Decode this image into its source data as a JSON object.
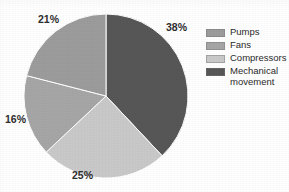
{
  "chart_data": {
    "type": "pie",
    "title": "",
    "subtitle": "",
    "xlabel": "",
    "ylabel": "",
    "grid": false,
    "legend_position": "right",
    "start_angle_deg": 0,
    "direction": "clockwise",
    "categories": [
      "Pumps",
      "Fans",
      "Compressors",
      "Mechanical movement"
    ],
    "values": [
      21,
      16,
      25,
      38
    ],
    "value_unit": "%",
    "data_labels": [
      "21%",
      "16%",
      "25%",
      "38%"
    ],
    "slices": [
      {
        "label": "Pumps",
        "value": 21,
        "data_label": "21%",
        "color": "#9c9c9c"
      },
      {
        "label": "Fans",
        "value": 16,
        "data_label": "16%",
        "color": "#a6a6a6"
      },
      {
        "label": "Compressors",
        "value": 25,
        "data_label": "25%",
        "color": "#c9c9c9"
      },
      {
        "label": "Mechanical movement",
        "value": 38,
        "data_label": "38%",
        "color": "#575757"
      }
    ],
    "legend_entries": [
      {
        "label": "Pumps",
        "color": "#9c9c9c"
      },
      {
        "label": "Fans",
        "color": "#a6a6a6"
      },
      {
        "label": "Compressors",
        "color": "#c9c9c9"
      },
      {
        "label": "Mechanical\nmovement",
        "color": "#575757"
      }
    ],
    "colors": {
      "pumps": "#9c9c9c",
      "fans": "#a6a6a6",
      "compressors": "#c9c9c9",
      "mechanical_movement": "#575757",
      "background": "#ffffff",
      "text": "#2b2b2b",
      "slice_outline": "#ffffff"
    }
  }
}
